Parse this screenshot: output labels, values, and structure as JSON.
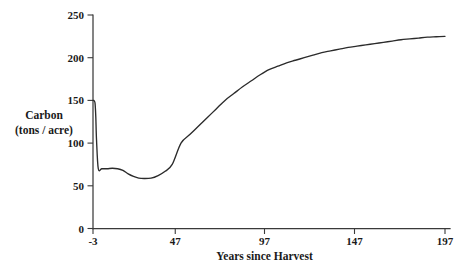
{
  "chart_data": {
    "type": "line",
    "title": "",
    "xlabel": "Years since Harvest",
    "ylabel": "Carbon",
    "ylabel_units": "(tons / acre)",
    "xlim": [
      -3,
      197
    ],
    "ylim": [
      0,
      250
    ],
    "grid": false,
    "legend": null,
    "xticks": [
      -3,
      47,
      97,
      147,
      197
    ],
    "xtick_labels": [
      "-3",
      "47",
      "97",
      "147",
      "197"
    ],
    "yticks": [
      0,
      50,
      100,
      150,
      200,
      250
    ],
    "ytick_labels": [
      "0",
      "50",
      "100",
      "150",
      "200",
      "250"
    ],
    "series": [
      {
        "name": "Carbon stock",
        "x": [
          -3,
          -2.6,
          -2.2,
          -1.8,
          -1.4,
          -1.0,
          0,
          2,
          5,
          8,
          11,
          14,
          17,
          20,
          23,
          26,
          30,
          34,
          38,
          42,
          47,
          52,
          57,
          62,
          67,
          72,
          77,
          82,
          87,
          92,
          97,
          102,
          107,
          112,
          117,
          122,
          127,
          132,
          137,
          142,
          147,
          152,
          157,
          162,
          167,
          172,
          177,
          182,
          187,
          192,
          197
        ],
        "y": [
          150,
          150,
          149,
          146,
          130,
          104,
          70,
          70,
          70,
          70.5,
          70,
          68,
          64,
          61,
          59,
          58.5,
          59,
          62,
          67,
          75,
          100,
          110,
          120,
          130,
          140,
          150,
          158,
          166,
          173,
          180,
          186,
          190,
          194,
          197,
          200,
          203,
          206,
          208,
          210,
          212,
          213.5,
          215,
          216.5,
          218,
          219.5,
          221,
          222,
          223,
          224,
          224.5,
          225
        ]
      }
    ],
    "annotations": []
  },
  "axis": {
    "y_label_line1": "Carbon",
    "y_label_line2": "(tons / acre)",
    "x_label": "Years since Harvest"
  }
}
